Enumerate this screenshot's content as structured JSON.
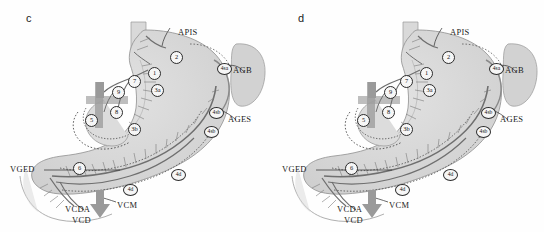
{
  "figure": {
    "background_color": "#fefefe",
    "organ_fill": "#d6d6d6",
    "organ_stroke": "#8c8c8c",
    "vessel_color": "#8e8e8e",
    "vessel_dark": "#6f6f6f",
    "line_color": "#2b2b2b",
    "text_color": "#1c1c1c",
    "panels": [
      {
        "letter": "c",
        "vessel_labels": [
          {
            "text": "APIS",
            "x": 178,
            "y": 31
          },
          {
            "text": "AGB",
            "x": 233,
            "y": 70
          },
          {
            "text": "AGES",
            "x": 228,
            "y": 119
          },
          {
            "text": "VGED",
            "x": 10,
            "y": 169
          },
          {
            "text": "VCDA",
            "x": 65,
            "y": 209
          },
          {
            "text": "VCD",
            "x": 72,
            "y": 220
          },
          {
            "text": "VCM",
            "x": 117,
            "y": 205
          }
        ],
        "node_labels": [
          {
            "text": "2",
            "x": 170,
            "y": 51,
            "wide": false
          },
          {
            "text": "1",
            "x": 148,
            "y": 67,
            "wide": false
          },
          {
            "text": "3a",
            "x": 151,
            "y": 84,
            "wide": false
          },
          {
            "text": "7",
            "x": 128,
            "y": 75,
            "wide": false
          },
          {
            "text": "9",
            "x": 112,
            "y": 86,
            "wide": false
          },
          {
            "text": "8",
            "x": 110,
            "y": 106,
            "wide": false
          },
          {
            "text": "5",
            "x": 85,
            "y": 114,
            "wide": false
          },
          {
            "text": "4sa",
            "x": 217,
            "y": 63,
            "wide": true
          },
          {
            "text": "4sb",
            "x": 209,
            "y": 107,
            "wide": true
          },
          {
            "text": "4sb",
            "x": 204,
            "y": 126,
            "wide": true
          },
          {
            "text": "4d",
            "x": 171,
            "y": 169,
            "wide": true
          },
          {
            "text": "4d",
            "x": 123,
            "y": 184,
            "wide": true
          },
          {
            "text": "3b",
            "x": 128,
            "y": 123,
            "wide": false
          },
          {
            "text": "6",
            "x": 73,
            "y": 162,
            "wide": false
          }
        ]
      },
      {
        "letter": "d",
        "vessel_labels": [
          {
            "text": "APIS",
            "x": 178,
            "y": 31
          },
          {
            "text": "AGB",
            "x": 233,
            "y": 70
          },
          {
            "text": "AGES",
            "x": 228,
            "y": 119
          },
          {
            "text": "VGED",
            "x": 10,
            "y": 169
          },
          {
            "text": "VCDA",
            "x": 65,
            "y": 209
          },
          {
            "text": "VCD",
            "x": 72,
            "y": 220
          },
          {
            "text": "VCM",
            "x": 117,
            "y": 205
          }
        ],
        "node_labels": [
          {
            "text": "2",
            "x": 170,
            "y": 51,
            "wide": false
          },
          {
            "text": "1",
            "x": 148,
            "y": 67,
            "wide": false
          },
          {
            "text": "3a",
            "x": 151,
            "y": 84,
            "wide": false
          },
          {
            "text": "7",
            "x": 128,
            "y": 75,
            "wide": false
          },
          {
            "text": "9",
            "x": 112,
            "y": 86,
            "wide": false
          },
          {
            "text": "8",
            "x": 110,
            "y": 106,
            "wide": false
          },
          {
            "text": "5",
            "x": 85,
            "y": 114,
            "wide": false
          },
          {
            "text": "4sa",
            "x": 217,
            "y": 63,
            "wide": true
          },
          {
            "text": "4sb",
            "x": 209,
            "y": 107,
            "wide": true
          },
          {
            "text": "4sb",
            "x": 204,
            "y": 126,
            "wide": true
          },
          {
            "text": "4d",
            "x": 171,
            "y": 169,
            "wide": true
          },
          {
            "text": "4d",
            "x": 123,
            "y": 184,
            "wide": true
          },
          {
            "text": "3b",
            "x": 128,
            "y": 123,
            "wide": false
          },
          {
            "text": "6",
            "x": 73,
            "y": 162,
            "wide": false
          }
        ]
      }
    ]
  }
}
